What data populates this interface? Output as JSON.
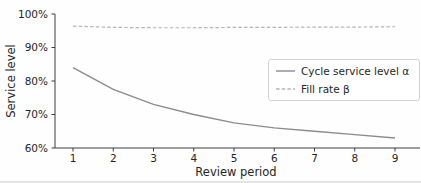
{
  "chart_data": {
    "type": "line",
    "title": "",
    "xlabel": "Review period",
    "ylabel": "Service level",
    "x": [
      1,
      2,
      3,
      4,
      5,
      6,
      7,
      8,
      9
    ],
    "x_tick_labels": [
      "1",
      "2",
      "3",
      "4",
      "5",
      "6",
      "7",
      "8",
      "9"
    ],
    "y_ticks": [
      60,
      70,
      80,
      90,
      100
    ],
    "y_tick_labels": [
      "60%",
      "70%",
      "80%",
      "90%",
      "100%"
    ],
    "xlim": [
      0.55,
      9.6
    ],
    "ylim": [
      60,
      100
    ],
    "grid": false,
    "legend_position": "center right",
    "series": [
      {
        "name": "Cycle service level α",
        "style": "solid",
        "color": "#8c8c8c",
        "values": [
          84,
          77.5,
          73,
          70,
          67.5,
          66,
          65,
          64,
          63
        ]
      },
      {
        "name": "Fill rate β",
        "style": "dashed",
        "color": "#b5b5b5",
        "values": [
          96.4,
          96.0,
          95.9,
          95.9,
          96.0,
          96.0,
          96.1,
          96.1,
          96.2
        ]
      }
    ]
  },
  "page": {
    "bottom_rule_color": "#c9c9c9"
  }
}
